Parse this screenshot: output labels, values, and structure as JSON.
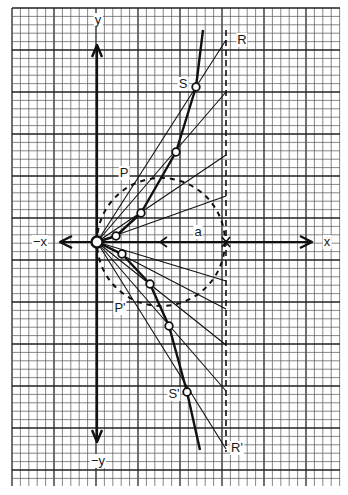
{
  "diagram": {
    "title": "",
    "type": "strophoid construction on graph paper",
    "grid": {
      "x0": 12,
      "y0": 8,
      "x1": 340,
      "y1": 486,
      "minor_spacing": 8.4,
      "major_every": 5,
      "minor_color": "#555555",
      "major_color": "#222222"
    },
    "origin": {
      "x": 97,
      "y": 242
    },
    "axes": {
      "x_label": "x",
      "neg_x_label": "−x",
      "y_label": "y",
      "neg_y_label": "−y",
      "x_arrow_right": 312,
      "x_arrow_left": 60,
      "y_arrow_top": 45,
      "y_arrow_bottom": 442
    },
    "guide_line": {
      "x": 226,
      "y_top": 30,
      "y_bottom": 452,
      "style": "dashed"
    },
    "circle": {
      "cx": 161,
      "cy": 242,
      "r": 64,
      "style": "dashed"
    },
    "rays_end_y": [
      40,
      92,
      155,
      196,
      281,
      309,
      345,
      391,
      449
    ],
    "curve_points": [
      [
        203,
        30
      ],
      [
        196,
        87
      ],
      [
        176,
        152
      ],
      [
        141,
        213
      ],
      [
        116,
        236
      ],
      [
        97,
        242
      ],
      [
        122,
        254
      ],
      [
        150,
        284
      ],
      [
        169,
        326
      ],
      [
        187,
        392
      ],
      [
        200,
        450
      ]
    ],
    "marked_points": [
      [
        196,
        87
      ],
      [
        176,
        152
      ],
      [
        141,
        213
      ],
      [
        116,
        236
      ],
      [
        97,
        242
      ],
      [
        122,
        254
      ],
      [
        150,
        284
      ],
      [
        169,
        326
      ],
      [
        187,
        392
      ]
    ],
    "midline_arrow": {
      "x": 160,
      "y": 242,
      "direction": "left"
    },
    "labels": {
      "R": "R",
      "R_prime": "R'",
      "S": "S",
      "S_prime": "S'",
      "P": "P",
      "P_prime": "P'",
      "a": "a"
    },
    "label_positions": {
      "R": [
        242,
        40
      ],
      "R_prime": [
        237,
        448
      ],
      "S": [
        183,
        84
      ],
      "S_prime": [
        174,
        394
      ],
      "P": [
        124,
        173
      ],
      "P_prime": [
        120,
        308
      ],
      "a": [
        198,
        232
      ],
      "x": [
        327,
        242
      ],
      "neg_x": [
        40,
        242
      ],
      "y": [
        98,
        20
      ],
      "neg_y": [
        98,
        461
      ]
    }
  }
}
